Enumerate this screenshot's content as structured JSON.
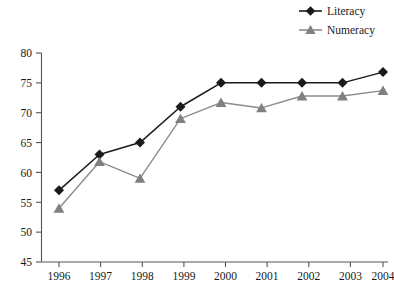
{
  "chart_data": {
    "type": "line",
    "title": "",
    "xlabel": "",
    "ylabel": "",
    "categories": [
      "1996",
      "1997",
      "1998",
      "1999",
      "2000",
      "2001",
      "2002",
      "2003",
      "2004"
    ],
    "x": [
      1996,
      1997,
      1998,
      1999,
      2000,
      2001,
      2002,
      2003,
      2004
    ],
    "series": [
      {
        "name": "Literacy",
        "color": "#1a1a1a",
        "marker": "diamond",
        "values": [
          57,
          63,
          65,
          71,
          75,
          75,
          75,
          75,
          76.8
        ]
      },
      {
        "name": "Numeracy",
        "color": "#808080",
        "marker": "triangle",
        "values": [
          54,
          61.8,
          59,
          69,
          71.7,
          70.8,
          72.8,
          72.8,
          73.7
        ]
      }
    ],
    "ylim": [
      45,
      80
    ],
    "yticks": [
      45,
      50,
      55,
      60,
      65,
      70,
      75,
      80
    ],
    "ytick_labels": [
      "45",
      "50",
      "55",
      "60",
      "65",
      "70",
      "75",
      "80"
    ],
    "xtick_labels": [
      "1996",
      "1997",
      "1998",
      "1999",
      "2000",
      "2001",
      "2002",
      "2003",
      "2004"
    ],
    "grid": false,
    "legend_position": "top-right",
    "legend_entries": [
      "Literacy",
      "Numeracy"
    ]
  },
  "axes": {
    "y_axis_name": "value-axis",
    "x_axis_name": "year-axis"
  }
}
